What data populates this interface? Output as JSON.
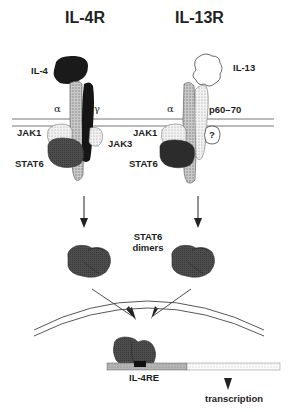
{
  "titles": {
    "left": "IL-4R",
    "right": "IL-13R"
  },
  "left_receptor": {
    "ligand": "IL-4",
    "chain_alpha": "α",
    "chain_gamma": "γ",
    "kinase_1": "JAK1",
    "kinase_2": "JAK3",
    "transcription_factor": "STAT6"
  },
  "right_receptor": {
    "ligand": "IL-13",
    "chain_alpha": "α",
    "chain_other": "p60–70",
    "kinase_1": "JAK1",
    "unknown_kinase": "?",
    "transcription_factor": "STAT6"
  },
  "dimers_label_line1": "STAT6",
  "dimers_label_line2": "dimers",
  "dna": {
    "element": "IL-4RE",
    "output": "transcription"
  },
  "colors": {
    "il4": "#1a1a1a",
    "gamma_chain": "#151515",
    "alpha_chain": "#bdbdbd",
    "jak1": "#e8e8e8",
    "jak3": "#d6d6d6",
    "stat6": "#4a4a4a",
    "il13": "#ffffff",
    "p60_70": "#dcdcdc",
    "membrane": "#777777"
  }
}
